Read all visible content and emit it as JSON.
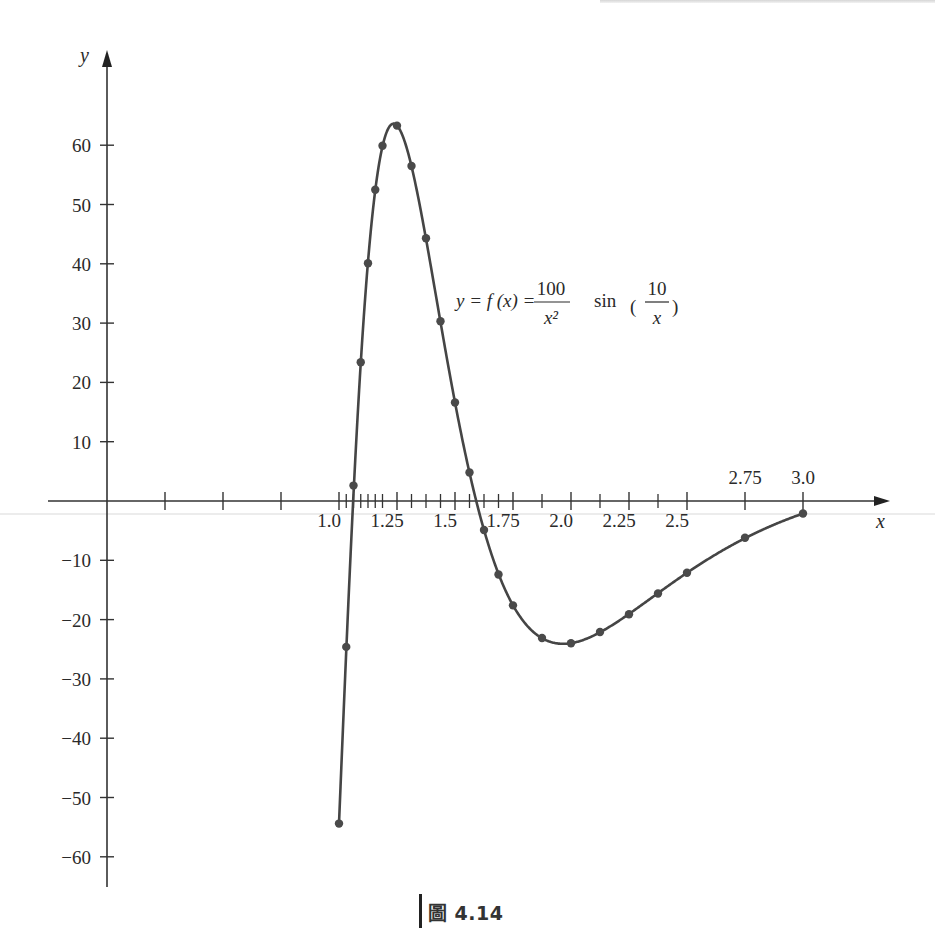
{
  "chart_data": {
    "type": "line",
    "title": "",
    "function_label": {
      "prefix": "y = f (x) = ",
      "numerator1": "100",
      "denominator1": "x²",
      "sin": "sin",
      "numerator2": "10",
      "denominator2": "x"
    },
    "xlabel": "x",
    "ylabel": "y",
    "xlim": [
      -0.25,
      3.35
    ],
    "ylim": [
      -65,
      72
    ],
    "grid": false,
    "x_tick_labels": [
      {
        "value": 1.0,
        "label": "1.0",
        "pos": "below"
      },
      {
        "value": 1.25,
        "label": "1.25",
        "pos": "below"
      },
      {
        "value": 1.5,
        "label": "1.5",
        "pos": "below"
      },
      {
        "value": 1.75,
        "label": "1.75",
        "pos": "below"
      },
      {
        "value": 2.0,
        "label": "2.0",
        "pos": "below"
      },
      {
        "value": 2.25,
        "label": "2.25",
        "pos": "below"
      },
      {
        "value": 2.5,
        "label": "2.5",
        "pos": "below"
      },
      {
        "value": 2.75,
        "label": "2.75",
        "pos": "above"
      },
      {
        "value": 3.0,
        "label": "3.0",
        "pos": "above"
      }
    ],
    "x_major_ticks": [
      0.25,
      0.5,
      0.75,
      1.0,
      1.25,
      1.5,
      1.75,
      2.0,
      2.25,
      2.5,
      2.75,
      3.0
    ],
    "x_minor_ticks": [
      1.03125,
      1.0625,
      1.09375,
      1.125,
      1.15625,
      1.1875,
      1.3125,
      1.375,
      1.4375,
      1.5625,
      1.625,
      1.6875,
      1.875,
      2.125,
      2.375
    ],
    "y_ticks": [
      60,
      50,
      40,
      30,
      20,
      10,
      -10,
      -20,
      -30,
      -40,
      -50,
      -60
    ],
    "y_tick_labels": [
      "60",
      "50",
      "40",
      "30",
      "20",
      "10",
      "−10",
      "−20",
      "−30",
      "−40",
      "−50",
      "−60"
    ],
    "series": [
      {
        "name": "y = 100/x^2 sin(10/x)",
        "x": [
          1.0,
          1.03125,
          1.0625,
          1.09375,
          1.125,
          1.15625,
          1.1875,
          1.25,
          1.3125,
          1.375,
          1.4375,
          1.5,
          1.5625,
          1.625,
          1.6875,
          1.75,
          1.875,
          2.0,
          2.125,
          2.25,
          2.375,
          2.5,
          2.75,
          3.0
        ],
        "y": [
          -54.4,
          -24.6,
          2.6,
          23.4,
          40.1,
          52.5,
          59.9,
          63.3,
          56.5,
          44.3,
          30.3,
          16.6,
          4.8,
          -4.9,
          -12.4,
          -17.6,
          -23.1,
          -24.0,
          -22.1,
          -19.1,
          -15.6,
          -12.1,
          -6.2,
          -2.1
        ]
      }
    ],
    "colors": {
      "curve": "#454545",
      "axis": "#333333",
      "text": "#2a2a2a"
    }
  },
  "caption": {
    "figure_label": "圖 4.14"
  }
}
